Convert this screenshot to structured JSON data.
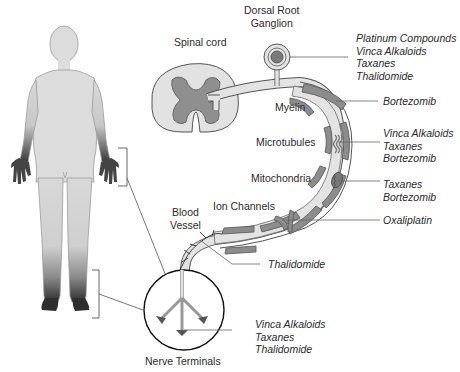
{
  "structures": {
    "drg": "Dorsal Root\nGanglion",
    "drg_line1": "Dorsal Root",
    "drg_line2": "Ganglion",
    "spinal_cord": "Spinal cord",
    "myelin": "Myelin",
    "microtubules": "Microtubules",
    "mitochondria": "Mitochondria",
    "ion_channels": "Ion Channels",
    "blood_vessel_line1": "Blood",
    "blood_vessel_line2": "Vessel",
    "nerve_terminals": "Nerve Terminals"
  },
  "drugs": {
    "drg": [
      "Platinum Compounds",
      "Vinca Alkaloids",
      "Taxanes",
      "Thalidomide"
    ],
    "myelin": [
      "Bortezomib"
    ],
    "microtubules": [
      "Vinca Alkaloids",
      "Taxanes",
      "Bortezomib"
    ],
    "mitochondria": [
      "Taxanes",
      "Bortezomib"
    ],
    "ion_channels": [
      "Oxaliplatin"
    ],
    "blood_vessel": [
      "Thalidomide"
    ],
    "nerve_terminals": [
      "Vinca Alkaloids",
      "Taxanes",
      "Thalidomide"
    ]
  },
  "colors": {
    "body_light": "#dcdcdc",
    "body_dark": "#3a3a3a",
    "axon_fill": "#e3e3e3",
    "myelin_fill": "#8c8c8c",
    "grey_matter": "#8f8f8f",
    "outline": "#555555"
  }
}
